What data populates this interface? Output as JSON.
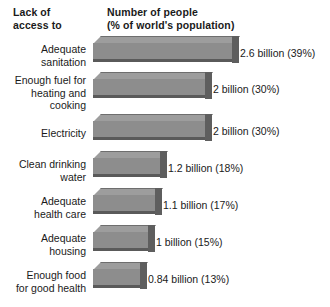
{
  "header": {
    "left_col_line1": "Lack of",
    "left_col_line2": "access to",
    "right_col_line1": "Number of people",
    "right_col_line2": "(% of world's population)"
  },
  "chart_data": {
    "type": "bar",
    "orientation": "horizontal",
    "title": "",
    "xlabel": "Number of people (% of world's population)",
    "ylabel": "Lack of access to",
    "grid": false,
    "legend": null,
    "units": "billions of people",
    "xlim": [
      0,
      2.6
    ],
    "categories": [
      "Adequate sanitation",
      "Enough fuel for heating and cooking",
      "Electricity",
      "Clean drinking water",
      "Adequate health care",
      "Adequate housing",
      "Enough food for good health"
    ],
    "values": [
      2.6,
      2,
      2,
      1.2,
      1.1,
      1,
      0.84
    ],
    "percentages": [
      39,
      30,
      30,
      18,
      17,
      15,
      13
    ],
    "data_labels": [
      "2.6 billion (39%)",
      "2 billion (30%)",
      "2 billion (30%)",
      "1.2 billion (18%)",
      "1.1 billion (17%)",
      "1 billion (15%)",
      "0.84 billion (13%)"
    ],
    "colors": {
      "bar_top_face": "#9d9d9d",
      "bar_front_face": "#8d8d8d",
      "bar_side_face": "#5e5e5e",
      "bar_bottom_edge": "#5a5a5a",
      "background": "#ffffff",
      "text": "#1a1a1a"
    }
  },
  "bars": [
    {
      "category_label": "Adequate\nsanitation",
      "value_label": "2.6 billion (39%)",
      "value": 2.6,
      "percent": 39,
      "row_top": 2,
      "bar_width": 139,
      "label_left": 240
    },
    {
      "category_label": "Enough fuel for\nheating and\ncooking",
      "value_label": "2 billion (30%)",
      "value": 2,
      "percent": 30,
      "row_top": 38,
      "bar_width": 112,
      "label_left": 213
    },
    {
      "category_label": "Electricity",
      "value_label": "2 billion (30%)",
      "value": 2,
      "percent": 30,
      "row_top": 80,
      "bar_width": 112,
      "label_left": 213
    },
    {
      "category_label": "Clean drinking\nwater",
      "value_label": "1.2 billion (18%)",
      "value": 1.2,
      "percent": 18,
      "row_top": 117,
      "bar_width": 67,
      "label_left": 168
    },
    {
      "category_label": "Adequate\nhealth care",
      "value_label": "1.1 billion (17%)",
      "value": 1.1,
      "percent": 17,
      "row_top": 154,
      "bar_width": 62,
      "label_left": 163
    },
    {
      "category_label": "Adequate\nhousing",
      "value_label": "1 billion (15%)",
      "value": 1,
      "percent": 15,
      "row_top": 191,
      "bar_width": 55,
      "label_left": 156
    },
    {
      "category_label": "Enough food\nfor good health",
      "value_label": "0.84 billion (13%)",
      "value": 0.84,
      "percent": 13,
      "row_top": 228,
      "bar_width": 47,
      "label_left": 148
    }
  ]
}
